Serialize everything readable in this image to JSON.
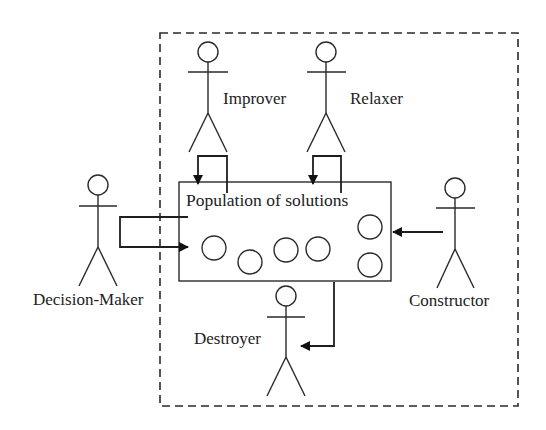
{
  "diagram": {
    "container": {
      "label": "",
      "style": "dashed"
    },
    "population": {
      "label": "Population of solutions",
      "solution_count": 7
    },
    "actors": [
      {
        "id": "improver",
        "label": "Improver"
      },
      {
        "id": "relaxer",
        "label": "Relaxer"
      },
      {
        "id": "decision_maker",
        "label": "Decision-Maker"
      },
      {
        "id": "constructor",
        "label": "Constructor"
      },
      {
        "id": "destroyer",
        "label": "Destroyer"
      }
    ],
    "flows": [
      {
        "from": "improver",
        "to": "population",
        "type": "read-write loop"
      },
      {
        "from": "relaxer",
        "to": "population",
        "type": "read-write loop"
      },
      {
        "from": "decision_maker",
        "to": "population",
        "type": "read-write loop"
      },
      {
        "from": "constructor",
        "to": "population",
        "type": "write"
      },
      {
        "from": "population",
        "to": "destroyer",
        "type": "read"
      }
    ]
  }
}
